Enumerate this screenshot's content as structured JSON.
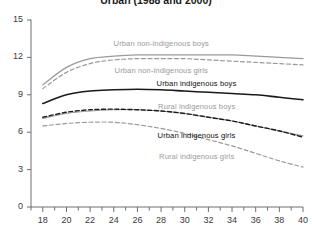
{
  "chart_data": {
    "type": "line",
    "title": "Urban (1988 and 2000)",
    "xlabel": "",
    "ylabel": "",
    "xlim": [
      17,
      40
    ],
    "ylim": [
      0,
      15
    ],
    "xticks": [
      18,
      20,
      22,
      24,
      26,
      28,
      30,
      32,
      34,
      36,
      38,
      40
    ],
    "xtick_labels": [
      "18",
      "20",
      "22",
      "24",
      "26",
      "28",
      "30",
      "32",
      "34",
      "36",
      "38",
      "40"
    ],
    "yticks": [
      0,
      3,
      6,
      9,
      12,
      15
    ],
    "ytick_labels": [
      "0",
      "3",
      "6",
      "9",
      "12",
      "15"
    ],
    "grid": false,
    "legend_position": "inline-annotations",
    "x": [
      18,
      20,
      22,
      24,
      26,
      28,
      30,
      32,
      34,
      36,
      38,
      40
    ],
    "series": [
      {
        "name": "Urban non-indigenous boys",
        "color": "#9a9a9a",
        "style": "solid",
        "width": 1.2,
        "values": [
          9.8,
          11.2,
          11.9,
          12.1,
          12.2,
          12.2,
          12.2,
          12.2,
          12.2,
          12.1,
          12.0,
          11.9
        ],
        "label_x": 28,
        "label_y": 13.1
      },
      {
        "name": "Urban non-indigenous girls",
        "color": "#9a9a9a",
        "style": "dashed",
        "width": 1.2,
        "values": [
          9.5,
          10.8,
          11.5,
          11.8,
          11.9,
          11.9,
          11.9,
          11.8,
          11.7,
          11.6,
          11.5,
          11.4
        ],
        "label_x": 28,
        "label_y": 10.9
      },
      {
        "name": "Urban indigenous boys",
        "color": "#1a1a1a",
        "style": "solid",
        "width": 1.6,
        "values": [
          8.3,
          9.0,
          9.3,
          9.4,
          9.45,
          9.4,
          9.3,
          9.2,
          9.1,
          9.0,
          8.8,
          8.6
        ],
        "label_x": 31,
        "label_y": 9.9
      },
      {
        "name": "Rural indigenous boys",
        "color": "#9a9a9a",
        "style": "solid",
        "width": 1.2,
        "values": [
          7.1,
          7.5,
          7.7,
          7.8,
          7.8,
          7.7,
          7.5,
          7.2,
          6.9,
          6.5,
          6.1,
          5.7
        ],
        "label_x": 31,
        "label_y": 8.0
      },
      {
        "name": "Urban indigenous girls",
        "color": "#1a1a1a",
        "style": "dashed",
        "width": 1.4,
        "values": [
          7.2,
          7.6,
          7.8,
          7.85,
          7.8,
          7.7,
          7.5,
          7.2,
          6.9,
          6.5,
          6.1,
          5.6
        ],
        "label_x": 31,
        "label_y": 5.7
      },
      {
        "name": "Rural indigenous girls",
        "color": "#9a9a9a",
        "style": "dashed",
        "width": 1.2,
        "values": [
          6.5,
          6.7,
          6.8,
          6.8,
          6.6,
          6.3,
          5.9,
          5.4,
          4.9,
          4.3,
          3.7,
          3.2
        ],
        "label_x": 31,
        "label_y": 4.0
      }
    ]
  },
  "axes": {
    "axis_color": "#6e6e6e",
    "tick_color": "#6e6e6e"
  }
}
